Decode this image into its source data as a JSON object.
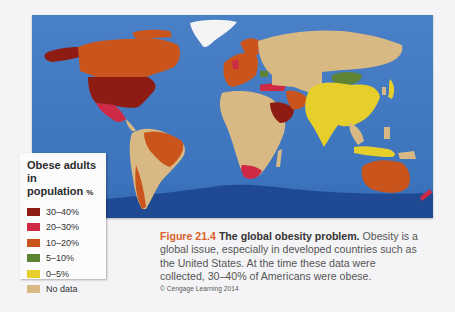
{
  "figure": {
    "number": "Figure 21.4",
    "title": "The global obesity problem.",
    "caption_lines": [
      " Obesity is a",
      "global issue, especially in developed countries such as",
      "the United States. At the time these data were",
      "collected, 30–40% of Americans were obese."
    ],
    "credit": "© Cengage Learning 2014"
  },
  "legend": {
    "title_line1": "Obese adults in",
    "title_line2": "population",
    "title_unit": "%",
    "items": [
      {
        "label": "30–40%",
        "color": "#8e1c12"
      },
      {
        "label": "20–30%",
        "color": "#cf2a45"
      },
      {
        "label": "10–20%",
        "color": "#c9551d"
      },
      {
        "label": "5–10%",
        "color": "#5f8335"
      },
      {
        "label": "0–5%",
        "color": "#e6cf2a"
      },
      {
        "label": "No data",
        "color": "#d9b983"
      }
    ]
  },
  "map": {
    "ocean_color": "#3f78c0",
    "deep_ocean_color": "#1e4a94",
    "ice_color": "#f5f5f5",
    "regions": [
      {
        "name": "United States",
        "category": "30–40%"
      },
      {
        "name": "Alaska",
        "category": "30–40%"
      },
      {
        "name": "Canada",
        "category": "10–20%"
      },
      {
        "name": "Mexico",
        "category": "20–30%"
      },
      {
        "name": "Brazil",
        "category": "10–20%"
      },
      {
        "name": "Argentina",
        "category": "10–20%"
      },
      {
        "name": "Western Europe",
        "category": "10–20%"
      },
      {
        "name": "United Kingdom",
        "category": "20–30%"
      },
      {
        "name": "Turkey",
        "category": "20–30%"
      },
      {
        "name": "Saudi Arabia",
        "category": "30–40%"
      },
      {
        "name": "Iran",
        "category": "10–20%"
      },
      {
        "name": "Mongolia",
        "category": "5–10%"
      },
      {
        "name": "China",
        "category": "0–5%"
      },
      {
        "name": "India",
        "category": "0–5%"
      },
      {
        "name": "South Africa",
        "category": "20–30%"
      },
      {
        "name": "Australia",
        "category": "10–20%"
      },
      {
        "name": "Russia",
        "category": "No data"
      },
      {
        "name": "Africa",
        "category": "No data"
      },
      {
        "name": "Greenland",
        "category": "No data"
      }
    ]
  }
}
